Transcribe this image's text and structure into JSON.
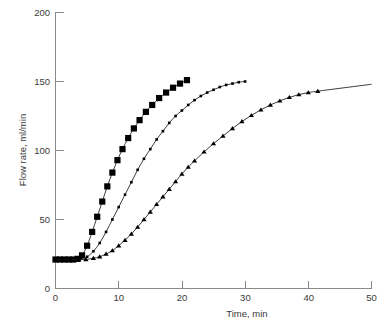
{
  "chart_data": {
    "type": "line",
    "title": "",
    "xlabel": "Time, min",
    "ylabel": "Flow rate, ml/min",
    "xlim": [
      0,
      50
    ],
    "ylim": [
      0,
      200
    ],
    "xticks": [
      0,
      10,
      20,
      30,
      40,
      50
    ],
    "yticks": [
      0,
      50,
      100,
      150,
      200
    ],
    "xtick_labels": [
      "0",
      "10",
      "20",
      "30",
      "40",
      "50"
    ],
    "ytick_labels": [
      "0",
      "50",
      "100",
      "150",
      "200"
    ],
    "grid": false,
    "legend": "none",
    "series": [
      {
        "name": "fast",
        "marker": "square",
        "marker_size": 6.2,
        "x": [
          0,
          0.7,
          1.4,
          2.1,
          2.8,
          3.5,
          4.2,
          5.0,
          5.8,
          6.6,
          7.4,
          8.2,
          9.0,
          9.8,
          10.6,
          11.5,
          12.4,
          13.3,
          14.3,
          15.3,
          16.4,
          17.5,
          18.6,
          19.7,
          20.8
        ],
        "y": [
          21,
          21,
          21,
          21,
          21,
          21.5,
          24,
          31,
          41,
          52,
          63,
          74,
          84,
          93,
          101,
          109,
          116,
          122,
          128,
          133,
          138,
          142,
          145.5,
          148.5,
          151
        ]
      },
      {
        "name": "medium",
        "marker": "diamond",
        "marker_size": 2.6,
        "x": [
          0,
          1.0,
          2.0,
          3.0,
          4.0,
          5.0,
          6.0,
          7.0,
          8.0,
          9.0,
          10.0,
          11.0,
          12.0,
          13.0,
          14.0,
          15.0,
          16.0,
          17.0,
          18.0,
          19.0,
          20.0,
          21.0,
          22.0,
          23.0,
          24.0,
          25.0,
          26.0,
          27.0,
          28.0,
          29.0,
          30.0
        ],
        "y": [
          21,
          21,
          21,
          21,
          21.5,
          23,
          27,
          33,
          41,
          50,
          59,
          68,
          77,
          86,
          94,
          101,
          108,
          114,
          120,
          125,
          129,
          133,
          136.5,
          139.5,
          142,
          144,
          146,
          147.5,
          148.5,
          149.5,
          150
        ]
      },
      {
        "name": "slow",
        "marker": "triangle",
        "marker_size": 4.2,
        "x": [
          0,
          1.2,
          2.4,
          3.6,
          4.8,
          6.0,
          7.0,
          8.0,
          9.0,
          10.0,
          11.0,
          12.0,
          13.0,
          14.0,
          15.0,
          16.0,
          17.0,
          18.0,
          19.0,
          20.0,
          21.0,
          22.0,
          23.5,
          25.0,
          26.5,
          28.0,
          29.5,
          31.0,
          32.5,
          34.0,
          35.5,
          37.0,
          38.5,
          40.0,
          41.5
        ],
        "y": [
          21,
          21,
          21,
          21,
          21,
          22,
          23,
          25,
          27.5,
          31,
          35,
          39.5,
          44.5,
          50,
          55.5,
          61,
          66.5,
          72,
          77.5,
          83,
          88,
          92.5,
          99,
          105,
          110.5,
          116,
          121,
          125.5,
          129.5,
          133,
          136,
          138.5,
          140.5,
          142,
          143
        ],
        "extended_line_to": {
          "x": 50,
          "y": 148
        }
      }
    ]
  },
  "axes": {
    "x_axis_name": "time-axis",
    "y_axis_name": "flow-rate-axis"
  }
}
